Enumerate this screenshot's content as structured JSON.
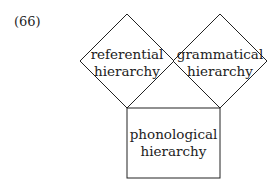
{
  "example_number": "(66)",
  "diagram": {
    "nodes": [
      {
        "id": "referential",
        "line1": "referential",
        "line2": "hierarchy",
        "shape": "diamond"
      },
      {
        "id": "grammatical",
        "line1": "grammatical",
        "line2": "hierarchy",
        "shape": "diamond"
      },
      {
        "id": "phonological",
        "line1": "phonological",
        "line2": "hierarchy",
        "shape": "square"
      }
    ],
    "colors": {
      "stroke": "#222222",
      "background": "#ffffff"
    }
  }
}
